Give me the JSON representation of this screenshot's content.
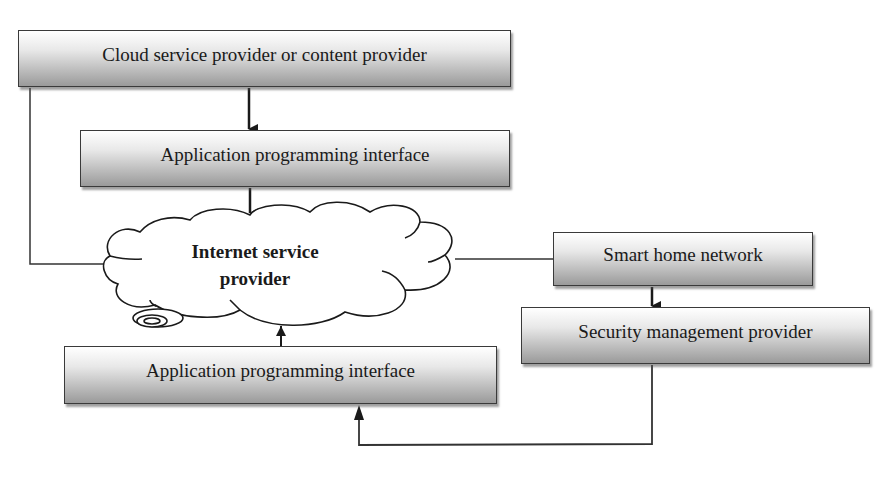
{
  "diagram": {
    "nodes": [
      {
        "id": "cloud_provider",
        "label": "Cloud service provider or content provider",
        "shape": "box"
      },
      {
        "id": "api_top",
        "label": "Application programming interface",
        "shape": "box"
      },
      {
        "id": "isp",
        "label_line1": "Internet service",
        "label_line2": "provider",
        "shape": "cloud"
      },
      {
        "id": "smart_home",
        "label": "Smart home network",
        "shape": "box"
      },
      {
        "id": "security",
        "label": "Security management provider",
        "shape": "box"
      },
      {
        "id": "api_bottom",
        "label": "Application programming interface",
        "shape": "box"
      }
    ],
    "edges": [
      {
        "from": "cloud_provider",
        "to": "api_top",
        "arrow": true
      },
      {
        "from": "api_top",
        "to": "isp",
        "arrow": true
      },
      {
        "from": "cloud_provider",
        "to": "isp",
        "arrow": false
      },
      {
        "from": "isp",
        "to": "smart_home",
        "arrow": false
      },
      {
        "from": "smart_home",
        "to": "security",
        "arrow": true
      },
      {
        "from": "api_bottom",
        "to": "isp",
        "arrow": true
      },
      {
        "from": "security",
        "to": "api_bottom",
        "arrow": true
      }
    ]
  }
}
